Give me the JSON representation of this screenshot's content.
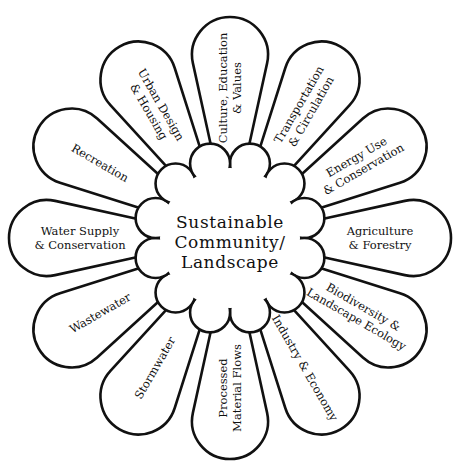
{
  "diagram": {
    "center": {
      "lines": [
        "Sustainable",
        "Community/",
        "Landscape"
      ]
    },
    "petals": [
      {
        "angle": -90,
        "lines": [
          "Culture, Education",
          "& Values"
        ]
      },
      {
        "angle": -60,
        "lines": [
          "Transportation",
          "& Circulation"
        ]
      },
      {
        "angle": -30,
        "lines": [
          "Energy Use",
          "& Conservation"
        ]
      },
      {
        "angle": 0,
        "lines": [
          "Agriculture",
          "& Forestry"
        ]
      },
      {
        "angle": 30,
        "lines": [
          "Biodiversity &",
          "Landscape Ecology"
        ]
      },
      {
        "angle": 60,
        "lines": [
          "Industry & Economy"
        ]
      },
      {
        "angle": 90,
        "lines": [
          "Processed",
          "Material Flows"
        ]
      },
      {
        "angle": 120,
        "lines": [
          "Stormwater"
        ]
      },
      {
        "angle": 150,
        "lines": [
          "Wastewater"
        ]
      },
      {
        "angle": 180,
        "lines": [
          "Water Supply",
          "& Conservation"
        ]
      },
      {
        "angle": -150,
        "lines": [
          "Recreation"
        ]
      },
      {
        "angle": -120,
        "lines": [
          "Urban Design",
          "& Housing"
        ]
      }
    ],
    "colors": {
      "stroke": "#111111",
      "fill": "#ffffff",
      "text": "#111111"
    }
  }
}
